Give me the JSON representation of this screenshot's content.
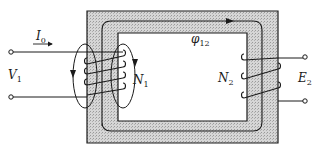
{
  "diagram": {
    "colors": {
      "core_fill": "#d4d4d4",
      "ink": "#1a1a1a",
      "background": "#ffffff"
    },
    "labels": {
      "current": {
        "main": "I",
        "sub": "0"
      },
      "primary_voltage": {
        "main": "V",
        "sub": "1"
      },
      "primary_turns": {
        "main": "N",
        "sub": "1"
      },
      "mutual_flux": {
        "main": "φ",
        "sub": "12"
      },
      "secondary_turns": {
        "main": "N",
        "sub": "2"
      },
      "secondary_emf": {
        "main": "E",
        "sub": "2"
      }
    },
    "components": [
      "magnetic-core",
      "primary-winding",
      "secondary-winding",
      "mutual-flux-path",
      "leakage-flux-loops"
    ]
  }
}
